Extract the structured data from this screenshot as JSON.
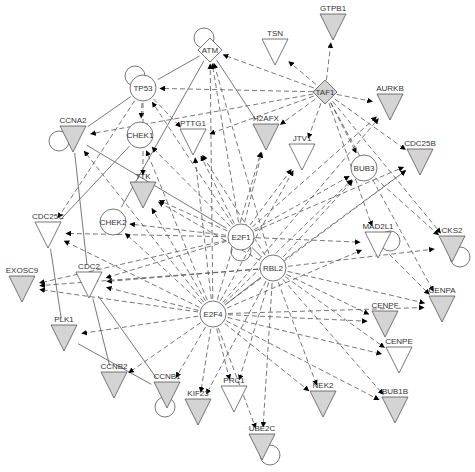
{
  "diagram": {
    "colors": {
      "gray_fill": "#d4d4d4",
      "white_fill": "#ffffff",
      "stroke": "#555555",
      "arrow": "#000000"
    },
    "nodes": [
      {
        "id": "GTPB1",
        "label": "GTPB1",
        "shape": "triangle",
        "fill": "gray",
        "x": 333,
        "y": 25,
        "loop": false
      },
      {
        "id": "TSN",
        "label": "TSN",
        "shape": "triangle",
        "fill": "white",
        "x": 275,
        "y": 50,
        "loop": false
      },
      {
        "id": "ATM",
        "label": "ATM",
        "shape": "diamond",
        "fill": "white",
        "x": 210,
        "y": 50,
        "loop": true
      },
      {
        "id": "TAF1",
        "label": "TAF1",
        "shape": "diamond",
        "fill": "gray",
        "x": 325,
        "y": 92,
        "loop": false
      },
      {
        "id": "TP53",
        "label": "TP53",
        "shape": "circle",
        "fill": "white",
        "x": 143,
        "y": 88,
        "loop": true
      },
      {
        "id": "AURKB",
        "label": "AURKB",
        "shape": "triangle",
        "fill": "gray",
        "x": 390,
        "y": 105,
        "loop": false
      },
      {
        "id": "CCNA2",
        "label": "CCNA2",
        "shape": "triangle",
        "fill": "gray",
        "x": 73,
        "y": 137,
        "loop": true
      },
      {
        "id": "CHEK1",
        "label": "CHEK1",
        "shape": "circle",
        "fill": "white",
        "x": 140,
        "y": 135,
        "loop": false
      },
      {
        "id": "PTTG1",
        "label": "PTTG1",
        "shape": "triangle",
        "fill": "white",
        "x": 193,
        "y": 140,
        "loop": false
      },
      {
        "id": "H2AFX",
        "label": "H2AFX",
        "shape": "triangle",
        "fill": "gray",
        "x": 266,
        "y": 135,
        "loop": false
      },
      {
        "id": "CDC25B",
        "label": "CDC25B",
        "shape": "triangle",
        "fill": "gray",
        "x": 420,
        "y": 160,
        "loop": false
      },
      {
        "id": "JTV1",
        "label": "JTV1",
        "shape": "triangle",
        "fill": "white",
        "x": 302,
        "y": 155,
        "loop": false
      },
      {
        "id": "BUB3",
        "label": "BUB3",
        "shape": "circle",
        "fill": "white",
        "x": 364,
        "y": 168,
        "loop": false
      },
      {
        "id": "TTK",
        "label": "TTK",
        "shape": "triangle",
        "fill": "gray",
        "x": 143,
        "y": 193,
        "loop": false
      },
      {
        "id": "CHEK2",
        "label": "CHEK2",
        "shape": "circle",
        "fill": "white",
        "x": 113,
        "y": 222,
        "loop": false
      },
      {
        "id": "CDC25C",
        "label": "CDC25C",
        "shape": "triangle",
        "fill": "white",
        "x": 48,
        "y": 233,
        "loop": false
      },
      {
        "id": "E2F1",
        "label": "E2F1",
        "shape": "circle",
        "fill": "white",
        "x": 241,
        "y": 237,
        "loop": true
      },
      {
        "id": "MAD2L1",
        "label": "MAD2L1",
        "shape": "triangle",
        "fill": "white",
        "x": 378,
        "y": 243,
        "loop": true
      },
      {
        "id": "CKS2",
        "label": "CKS2",
        "shape": "triangle",
        "fill": "gray",
        "x": 452,
        "y": 247,
        "loop": true
      },
      {
        "id": "RBL2",
        "label": "RBL2",
        "shape": "circle",
        "fill": "white",
        "x": 273,
        "y": 268,
        "loop": false
      },
      {
        "id": "EXOSC9",
        "label": "EXOSC9",
        "shape": "triangle",
        "fill": "gray",
        "x": 22,
        "y": 287,
        "loop": false
      },
      {
        "id": "CDC2",
        "label": "CDC2",
        "shape": "triangle",
        "fill": "white",
        "x": 89,
        "y": 283,
        "loop": false
      },
      {
        "id": "E2F4",
        "label": "E2F4",
        "shape": "circle",
        "fill": "white",
        "x": 213,
        "y": 314,
        "loop": false
      },
      {
        "id": "CENPA",
        "label": "CENPA",
        "shape": "triangle",
        "fill": "gray",
        "x": 442,
        "y": 307,
        "loop": false
      },
      {
        "id": "CENPF",
        "label": "CENPF",
        "shape": "triangle",
        "fill": "gray",
        "x": 385,
        "y": 322,
        "loop": false
      },
      {
        "id": "PLK1",
        "label": "PLK1",
        "shape": "triangle",
        "fill": "gray",
        "x": 64,
        "y": 336,
        "loop": false
      },
      {
        "id": "CENPE",
        "label": "CENPE",
        "shape": "triangle",
        "fill": "white",
        "x": 399,
        "y": 358,
        "loop": false
      },
      {
        "id": "CCNB2",
        "label": "CCNB2",
        "shape": "triangle",
        "fill": "gray",
        "x": 114,
        "y": 383,
        "loop": false
      },
      {
        "id": "CCNB1",
        "label": "CCNB1",
        "shape": "triangle",
        "fill": "gray",
        "x": 167,
        "y": 393,
        "loop": true
      },
      {
        "id": "KIF23",
        "label": "KIF23",
        "shape": "triangle",
        "fill": "gray",
        "x": 198,
        "y": 410,
        "loop": false
      },
      {
        "id": "PRC1",
        "label": "PRC1",
        "shape": "triangle",
        "fill": "white",
        "x": 234,
        "y": 397,
        "loop": false
      },
      {
        "id": "NEK2",
        "label": "NEK2",
        "shape": "triangle",
        "fill": "gray",
        "x": 323,
        "y": 402,
        "loop": false
      },
      {
        "id": "BUB1B",
        "label": "BUB1B",
        "shape": "triangle",
        "fill": "gray",
        "x": 395,
        "y": 408,
        "loop": false
      },
      {
        "id": "UBE2C",
        "label": "UBE2C",
        "shape": "triangle",
        "fill": "gray",
        "x": 262,
        "y": 445,
        "loop": true
      }
    ],
    "edges": [
      {
        "from": "ATM",
        "to": "TP53",
        "style": "solid",
        "arrow": false
      },
      {
        "from": "ATM",
        "to": "CHEK2",
        "style": "solid",
        "arrow": false
      },
      {
        "from": "ATM",
        "to": "H2AFX",
        "style": "solid",
        "arrow": false
      },
      {
        "from": "TP53",
        "to": "CCNA2",
        "style": "solid",
        "arrow": false
      },
      {
        "from": "CHEK1",
        "to": "CDC25C",
        "style": "solid",
        "arrow": false
      },
      {
        "from": "CCNA2",
        "to": "CDC2",
        "style": "solid",
        "arrow": false
      },
      {
        "from": "CDC25C",
        "to": "PLK1",
        "style": "solid",
        "arrow": false
      },
      {
        "from": "CDC2",
        "to": "CCNB2",
        "style": "solid",
        "arrow": false
      },
      {
        "from": "CDC2",
        "to": "CCNB1",
        "style": "solid",
        "arrow": false
      },
      {
        "from": "PLK1",
        "to": "CCNB1",
        "style": "solid",
        "arrow": false
      },
      {
        "from": "CCNA2",
        "to": "E2F1",
        "style": "solid",
        "arrow": false
      },
      {
        "from": "E2F1",
        "to": "RBL2",
        "style": "solid",
        "arrow": false
      },
      {
        "from": "RBL2",
        "to": "E2F4",
        "style": "solid",
        "arrow": false
      },
      {
        "from": "TAF1",
        "to": "GTPB1",
        "style": "dashed",
        "arrow": true
      },
      {
        "from": "TAF1",
        "to": "TSN",
        "style": "dashed",
        "arrow": true
      },
      {
        "from": "TAF1",
        "to": "ATM",
        "style": "dashed",
        "arrow": true
      },
      {
        "from": "TAF1",
        "to": "TP53",
        "style": "dashed",
        "arrow": true
      },
      {
        "from": "TAF1",
        "to": "AURKB",
        "style": "dashed",
        "arrow": true
      },
      {
        "from": "TAF1",
        "to": "CDC25B",
        "style": "dashed",
        "arrow": true
      },
      {
        "from": "TAF1",
        "to": "H2AFX",
        "style": "dashed",
        "arrow": true
      },
      {
        "from": "TAF1",
        "to": "JTV1",
        "style": "dashed",
        "arrow": true
      },
      {
        "from": "TAF1",
        "to": "BUB3",
        "style": "dashed",
        "arrow": true
      },
      {
        "from": "TAF1",
        "to": "CCNA2",
        "style": "dashed",
        "arrow": true
      },
      {
        "from": "TAF1",
        "to": "PTTG1",
        "style": "dashed",
        "arrow": true
      },
      {
        "from": "TAF1",
        "to": "MAD2L1",
        "style": "dashed",
        "arrow": true
      },
      {
        "from": "TAF1",
        "to": "CKS2",
        "style": "dashed",
        "arrow": true
      },
      {
        "from": "TAF1",
        "to": "CENPA",
        "style": "dashed",
        "arrow": true
      },
      {
        "from": "E2F1",
        "to": "ATM",
        "style": "dashed",
        "arrow": true
      },
      {
        "from": "E2F1",
        "to": "TP53",
        "style": "dashed",
        "arrow": true
      },
      {
        "from": "E2F1",
        "to": "CHEK1",
        "style": "dashed",
        "arrow": true
      },
      {
        "from": "E2F1",
        "to": "PTTG1",
        "style": "dashed",
        "arrow": true
      },
      {
        "from": "E2F1",
        "to": "H2AFX",
        "style": "dashed",
        "arrow": true
      },
      {
        "from": "E2F1",
        "to": "TTK",
        "style": "dashed",
        "arrow": true
      },
      {
        "from": "E2F1",
        "to": "CHEK2",
        "style": "dashed",
        "arrow": true
      },
      {
        "from": "E2F1",
        "to": "CDC25C",
        "style": "dashed",
        "arrow": true
      },
      {
        "from": "E2F1",
        "to": "CDC2",
        "style": "dashed",
        "arrow": true
      },
      {
        "from": "E2F1",
        "to": "EXOSC9",
        "style": "dashed",
        "arrow": true
      },
      {
        "from": "E2F1",
        "to": "AURKB",
        "style": "dashed",
        "arrow": true
      },
      {
        "from": "E2F1",
        "to": "CDC25B",
        "style": "dashed",
        "arrow": true
      },
      {
        "from": "E2F1",
        "to": "BUB3",
        "style": "dashed",
        "arrow": true
      },
      {
        "from": "E2F1",
        "to": "MAD2L1",
        "style": "dashed",
        "arrow": true
      },
      {
        "from": "E2F1",
        "to": "JTV1",
        "style": "dashed",
        "arrow": true
      },
      {
        "from": "RBL2",
        "to": "ATM",
        "style": "dashed",
        "arrow": true
      },
      {
        "from": "RBL2",
        "to": "TTK",
        "style": "dashed",
        "arrow": true
      },
      {
        "from": "RBL2",
        "to": "PTTG1",
        "style": "dashed",
        "arrow": true
      },
      {
        "from": "RBL2",
        "to": "CDC25B",
        "style": "dashed",
        "arrow": true
      },
      {
        "from": "RBL2",
        "to": "BUB3",
        "style": "dashed",
        "arrow": true
      },
      {
        "from": "RBL2",
        "to": "CKS2",
        "style": "dashed",
        "arrow": true
      },
      {
        "from": "RBL2",
        "to": "CENPA",
        "style": "dashed",
        "arrow": true
      },
      {
        "from": "RBL2",
        "to": "CENPF",
        "style": "dashed",
        "arrow": true
      },
      {
        "from": "RBL2",
        "to": "CENPE",
        "style": "dashed",
        "arrow": true
      },
      {
        "from": "RBL2",
        "to": "BUB1B",
        "style": "dashed",
        "arrow": true
      },
      {
        "from": "RBL2",
        "to": "NEK2",
        "style": "dashed",
        "arrow": true
      },
      {
        "from": "RBL2",
        "to": "UBE2C",
        "style": "dashed",
        "arrow": true
      },
      {
        "from": "RBL2",
        "to": "PRC1",
        "style": "dashed",
        "arrow": true
      },
      {
        "from": "RBL2",
        "to": "KIF23",
        "style": "dashed",
        "arrow": true
      },
      {
        "from": "RBL2",
        "to": "CDC2",
        "style": "dashed",
        "arrow": true
      },
      {
        "from": "RBL2",
        "to": "EXOSC9",
        "style": "dashed",
        "arrow": true
      },
      {
        "from": "E2F4",
        "to": "CHEK1",
        "style": "dashed",
        "arrow": true
      },
      {
        "from": "E2F4",
        "to": "CCNA2",
        "style": "dashed",
        "arrow": true
      },
      {
        "from": "E2F4",
        "to": "TTK",
        "style": "dashed",
        "arrow": true
      },
      {
        "from": "E2F4",
        "to": "CDC25C",
        "style": "dashed",
        "arrow": true
      },
      {
        "from": "E2F4",
        "to": "CDC2",
        "style": "dashed",
        "arrow": true
      },
      {
        "from": "E2F4",
        "to": "PLK1",
        "style": "dashed",
        "arrow": true
      },
      {
        "from": "E2F4",
        "to": "CCNB2",
        "style": "dashed",
        "arrow": true
      },
      {
        "from": "E2F4",
        "to": "CCNB1",
        "style": "dashed",
        "arrow": true
      },
      {
        "from": "E2F4",
        "to": "KIF23",
        "style": "dashed",
        "arrow": true
      },
      {
        "from": "E2F4",
        "to": "PRC1",
        "style": "dashed",
        "arrow": true
      },
      {
        "from": "E2F4",
        "to": "NEK2",
        "style": "dashed",
        "arrow": true
      },
      {
        "from": "E2F4",
        "to": "BUB1B",
        "style": "dashed",
        "arrow": true
      },
      {
        "from": "E2F4",
        "to": "CENPE",
        "style": "dashed",
        "arrow": true
      },
      {
        "from": "E2F4",
        "to": "CENPF",
        "style": "dashed",
        "arrow": true
      },
      {
        "from": "E2F4",
        "to": "CENPA",
        "style": "dashed",
        "arrow": true
      },
      {
        "from": "E2F4",
        "to": "MAD2L1",
        "style": "dashed",
        "arrow": true
      },
      {
        "from": "E2F4",
        "to": "AURKB",
        "style": "dashed",
        "arrow": true
      },
      {
        "from": "E2F4",
        "to": "CDC25B",
        "style": "dashed",
        "arrow": true
      },
      {
        "from": "E2F4",
        "to": "BUB3",
        "style": "dashed",
        "arrow": true
      },
      {
        "from": "E2F4",
        "to": "H2AFX",
        "style": "dashed",
        "arrow": true
      },
      {
        "from": "E2F4",
        "to": "JTV1",
        "style": "dashed",
        "arrow": true
      },
      {
        "from": "E2F4",
        "to": "PTTG1",
        "style": "dashed",
        "arrow": true
      },
      {
        "from": "E2F4",
        "to": "ATM",
        "style": "dashed",
        "arrow": true
      },
      {
        "from": "E2F4",
        "to": "CHEK2",
        "style": "dashed",
        "arrow": true
      },
      {
        "from": "E2F4",
        "to": "EXOSC9",
        "style": "dashed",
        "arrow": true
      },
      {
        "from": "E2F4",
        "to": "UBE2C",
        "style": "dashed",
        "arrow": true
      },
      {
        "from": "TP53",
        "to": "CHEK1",
        "style": "dashed",
        "arrow": true
      },
      {
        "from": "TP53",
        "to": "CDC25C",
        "style": "dashed",
        "arrow": true
      },
      {
        "from": "TP53",
        "to": "PTTG1",
        "style": "dashed",
        "arrow": true
      },
      {
        "from": "TP53",
        "to": "TTK",
        "style": "dashed",
        "arrow": true
      },
      {
        "from": "MAD2L1",
        "to": "CENPA",
        "style": "dashed",
        "arrow": true
      },
      {
        "from": "BUB3",
        "to": "CKS2",
        "style": "dashed",
        "arrow": true
      }
    ]
  }
}
